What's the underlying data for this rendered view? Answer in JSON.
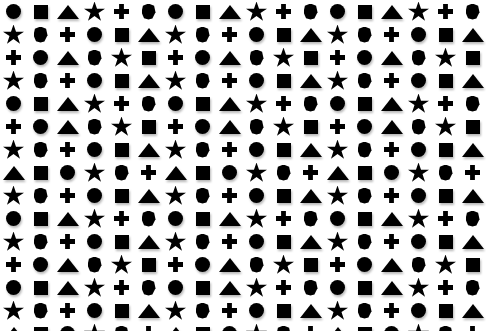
{
  "canvas": {
    "width": 486,
    "height": 331,
    "background_color": "#ffffff",
    "shape_color": "#000000",
    "shadow_color": "rgba(0,0,0,0.28)"
  },
  "legend": {
    "shape_names": [
      "circle",
      "square",
      "triangle",
      "star",
      "plus",
      "hexagon"
    ]
  },
  "grid": {
    "rows": 13,
    "columns": 18,
    "rows_data": [
      [
        "circle",
        "square",
        "triangle",
        "star",
        "plus",
        "hexagon",
        "circle",
        "square",
        "triangle",
        "star",
        "plus",
        "hexagon",
        "circle",
        "square",
        "triangle",
        "star",
        "plus",
        "hexagon"
      ],
      [
        "star",
        "hexagon",
        "plus",
        "circle",
        "square",
        "triangle",
        "star",
        "hexagon",
        "plus",
        "circle",
        "square",
        "triangle",
        "star",
        "hexagon",
        "plus",
        "circle",
        "square",
        "triangle"
      ],
      [
        "plus",
        "circle",
        "triangle",
        "hexagon",
        "star",
        "square",
        "plus",
        "circle",
        "triangle",
        "hexagon",
        "star",
        "square",
        "plus",
        "circle",
        "triangle",
        "hexagon",
        "star",
        "square"
      ],
      [
        "star",
        "hexagon",
        "plus",
        "circle",
        "square",
        "triangle",
        "star",
        "hexagon",
        "plus",
        "circle",
        "square",
        "triangle",
        "star",
        "hexagon",
        "plus",
        "circle",
        "square",
        "triangle"
      ],
      [
        "circle",
        "square",
        "triangle",
        "star",
        "plus",
        "hexagon",
        "circle",
        "square",
        "triangle",
        "star",
        "plus",
        "hexagon",
        "circle",
        "square",
        "triangle",
        "star",
        "plus",
        "hexagon"
      ],
      [
        "plus",
        "circle",
        "triangle",
        "hexagon",
        "star",
        "square",
        "plus",
        "circle",
        "triangle",
        "hexagon",
        "star",
        "square",
        "plus",
        "circle",
        "triangle",
        "hexagon",
        "star",
        "square"
      ],
      [
        "star",
        "hexagon",
        "plus",
        "circle",
        "square",
        "triangle",
        "star",
        "hexagon",
        "plus",
        "circle",
        "square",
        "triangle",
        "star",
        "hexagon",
        "plus",
        "circle",
        "square",
        "triangle"
      ],
      [
        "triangle",
        "square",
        "circle",
        "star",
        "hexagon",
        "plus",
        "triangle",
        "square",
        "circle",
        "star",
        "hexagon",
        "plus",
        "triangle",
        "square",
        "circle",
        "star",
        "hexagon",
        "plus"
      ],
      [
        "star",
        "hexagon",
        "plus",
        "circle",
        "square",
        "triangle",
        "star",
        "hexagon",
        "plus",
        "circle",
        "square",
        "triangle",
        "star",
        "hexagon",
        "plus",
        "circle",
        "square",
        "triangle"
      ],
      [
        "circle",
        "square",
        "triangle",
        "star",
        "plus",
        "hexagon",
        "circle",
        "square",
        "triangle",
        "star",
        "plus",
        "hexagon",
        "circle",
        "square",
        "triangle",
        "star",
        "plus",
        "hexagon"
      ],
      [
        "star",
        "hexagon",
        "plus",
        "circle",
        "square",
        "triangle",
        "star",
        "hexagon",
        "plus",
        "circle",
        "square",
        "triangle",
        "star",
        "hexagon",
        "plus",
        "circle",
        "square",
        "triangle"
      ],
      [
        "plus",
        "circle",
        "triangle",
        "hexagon",
        "star",
        "square",
        "plus",
        "circle",
        "triangle",
        "hexagon",
        "star",
        "square",
        "plus",
        "circle",
        "triangle",
        "hexagon",
        "star",
        "square"
      ],
      [
        "circle",
        "square",
        "triangle",
        "star",
        "plus",
        "hexagon",
        "circle",
        "square",
        "triangle",
        "star",
        "plus",
        "hexagon",
        "circle",
        "square",
        "triangle",
        "star",
        "plus",
        "hexagon"
      ],
      [
        "star",
        "hexagon",
        "plus",
        "circle",
        "square",
        "triangle",
        "star",
        "hexagon",
        "plus",
        "circle",
        "square",
        "triangle",
        "star",
        "hexagon",
        "plus",
        "circle",
        "square",
        "triangle"
      ],
      [
        "triangle",
        "square",
        "circle",
        "star",
        "hexagon",
        "plus",
        "triangle",
        "square",
        "circle",
        "star",
        "hexagon",
        "plus",
        "triangle",
        "square",
        "circle",
        "star",
        "hexagon",
        "plus"
      ]
    ]
  }
}
